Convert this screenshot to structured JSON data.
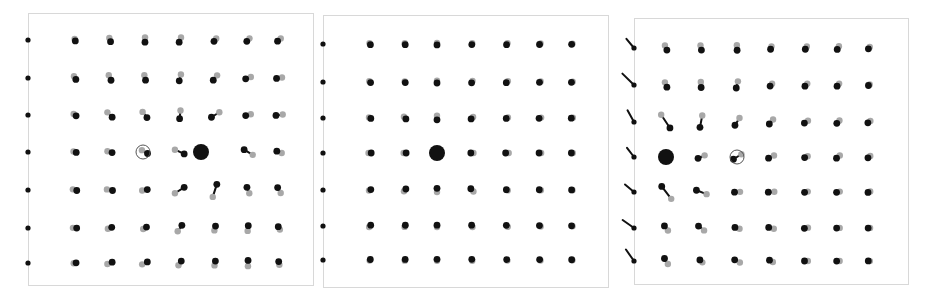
{
  "figure": {
    "width": 936,
    "height": 307,
    "background": "#ffffff",
    "type": "displacement-field-lattice"
  },
  "colors": {
    "background": "#ffffff",
    "frame_stroke": "#d8d8d8",
    "reference_dot": "#a8a8a8",
    "displaced_dot": "#111111",
    "vector_line": "#111111",
    "marker_circle": "#555555",
    "edge_particle": "#111111"
  },
  "style": {
    "reference_dot_radius": 3.2,
    "displaced_dot_radius": 3.4,
    "highlight_dot_radius": 8.0,
    "marker_circle_radius": 7.0,
    "vector_line_width": 2.0,
    "frame_stroke_width": 1.0,
    "edge_dot_radius": 2.6
  },
  "panels": [
    {
      "index": 0,
      "name": "panel-left",
      "frame": {
        "x": 28,
        "y": 13,
        "width": 285,
        "height": 272
      },
      "grid": {
        "cols_x": [
          75,
          110,
          145,
          180,
          215,
          248,
          279
        ],
        "rows_y": [
          40,
          78,
          115,
          152,
          190,
          228,
          263
        ]
      },
      "highlight": {
        "col": 4,
        "row": 3,
        "x": 201,
        "y": 152,
        "radius": 8.0
      },
      "marker": {
        "col": 2,
        "row": 3,
        "x": 143,
        "y": 152,
        "radius": 7.0
      },
      "source": {
        "x": 201,
        "y": 152
      },
      "amplitude": 17.0,
      "falloff": 1.0,
      "twist": 0.55,
      "chart_note": "large displacements, strong swirl; vectors point away from highlighted particle"
    },
    {
      "index": 1,
      "name": "panel-middle",
      "frame": {
        "x": 323,
        "y": 15,
        "width": 285,
        "height": 272
      },
      "grid": {
        "cols_x": [
          370,
          405,
          437,
          472,
          507,
          540,
          572
        ],
        "rows_y": [
          44,
          82,
          118,
          153,
          190,
          226,
          260
        ]
      },
      "highlight": {
        "col": 2,
        "row": 3,
        "x": 437,
        "y": 153,
        "radius": 8.0
      },
      "marker": null,
      "source": {
        "x": 437,
        "y": 153
      },
      "amplitude": 6.2,
      "falloff": 1.0,
      "twist": 0.0,
      "chart_note": "small purely radial displacements; dots nearly overlap"
    },
    {
      "index": 2,
      "name": "panel-right",
      "frame": {
        "x": 634,
        "y": 18,
        "width": 274,
        "height": 266
      },
      "grid": {
        "cols_x": [
          666,
          701,
          737,
          771,
          806,
          838,
          869
        ],
        "rows_y": [
          48,
          85,
          122,
          157,
          192,
          228,
          261
        ]
      },
      "highlight": {
        "col": 0,
        "row": 3,
        "x": 666,
        "y": 157,
        "radius": 8.0
      },
      "marker": {
        "col": 2,
        "row": 3,
        "x": 737,
        "y": 157,
        "radius": 7.0
      },
      "source": {
        "x": 666,
        "y": 157
      },
      "amplitude": 17.0,
      "falloff": 1.0,
      "twist": -0.55,
      "chart_note": "mirror image of left panel; highlighted particle at left edge of lattice"
    }
  ],
  "chart_data": {
    "type": "scatter",
    "title": "",
    "xlabel": "",
    "ylabel": "",
    "series": [
      {
        "name": "reference lattice positions",
        "marker": "gray dot",
        "color": "#a8a8a8"
      },
      {
        "name": "displaced positions",
        "marker": "black dot",
        "color": "#111111"
      },
      {
        "name": "displacement vectors",
        "marker": "line segment",
        "color": "#111111"
      },
      {
        "name": "highlighted source particle",
        "marker": "large black dot",
        "color": "#111111"
      },
      {
        "name": "tracked particle",
        "marker": "open circle outline",
        "color": "#555555"
      }
    ],
    "grid": false,
    "legend": "none",
    "panel_count": 3,
    "lattice_rows": 7,
    "lattice_cols": 7
  }
}
